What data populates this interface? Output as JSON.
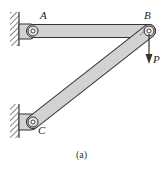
{
  "figure": {
    "caption": "(a)",
    "labels": {
      "A": "A",
      "B": "B",
      "C": "C",
      "P": "P"
    },
    "colors": {
      "member_fill": "#d2d2d2",
      "outline": "#333333",
      "background": "#ffffff"
    },
    "elements": [
      {
        "type": "wall-support",
        "name": "A",
        "description": "pinned support on left wall"
      },
      {
        "type": "wall-support",
        "name": "C",
        "description": "pinned support on left wall"
      },
      {
        "type": "bar",
        "name": "AB",
        "description": "horizontal member from A to B"
      },
      {
        "type": "bar",
        "name": "BC",
        "description": "inclined member from C to B"
      },
      {
        "type": "load",
        "name": "P",
        "description": "downward force at B"
      }
    ]
  }
}
